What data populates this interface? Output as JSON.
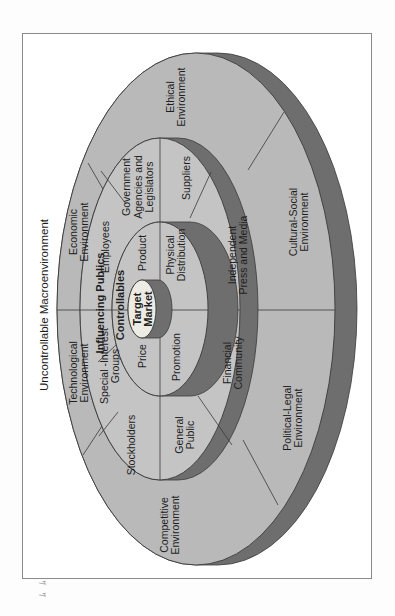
{
  "figure": {
    "title": "Uncontrollable Macroenvironment",
    "orientation": "rotated 90° counter-clockwise",
    "colors": {
      "disk_fill": "#b9b9b9",
      "ring_fill": "#c4c4c4",
      "rim_fill": "#6e6e6e",
      "target_fill": "#ecebe4",
      "line": "#3a3a3a"
    },
    "layers": {
      "outer": {
        "name": "Uncontrollable Macroenvironment",
        "segments": [
          {
            "id": "ethical",
            "lines": [
              "Ethical",
              "Environment"
            ]
          },
          {
            "id": "economic",
            "lines": [
              "Economic",
              "Environment"
            ]
          },
          {
            "id": "technological",
            "lines": [
              "Technological",
              "Environment"
            ]
          },
          {
            "id": "competitive",
            "lines": [
              "Competitive",
              "Environment"
            ]
          },
          {
            "id": "political-legal",
            "lines": [
              "Political-Legal",
              "Environment"
            ]
          },
          {
            "id": "cultural-social",
            "lines": [
              "Cultural-Social",
              "Environment"
            ]
          }
        ]
      },
      "middle": {
        "name": "Influencing Publics",
        "segments": [
          {
            "id": "government",
            "lines": [
              "Government",
              "Agencies and",
              "Legislators"
            ]
          },
          {
            "id": "employees",
            "lines": [
              "Employees"
            ]
          },
          {
            "id": "special-interest",
            "lines": [
              "Special -Interest",
              "Groups"
            ]
          },
          {
            "id": "stockholders",
            "lines": [
              "Stockholders"
            ]
          },
          {
            "id": "general-public",
            "lines": [
              "General",
              "Public"
            ]
          },
          {
            "id": "financial-community",
            "lines": [
              "Financial",
              "Community"
            ]
          },
          {
            "id": "independent-press",
            "lines": [
              "Independent",
              "Press and Media"
            ]
          },
          {
            "id": "suppliers",
            "lines": [
              "Suppliers"
            ]
          }
        ]
      },
      "inner": {
        "name": "Controllables",
        "segments": [
          {
            "id": "product",
            "lines": [
              "Product"
            ]
          },
          {
            "id": "price",
            "lines": [
              "Price"
            ]
          },
          {
            "id": "promotion",
            "lines": [
              "Promotion"
            ]
          },
          {
            "id": "physical-distribution",
            "lines": [
              "Physical",
              "Distribution"
            ]
          }
        ]
      },
      "core": {
        "name": "Target Market",
        "lines": [
          "Target",
          "Market"
        ]
      }
    },
    "page_mark": "ﾑ ﾑ"
  }
}
